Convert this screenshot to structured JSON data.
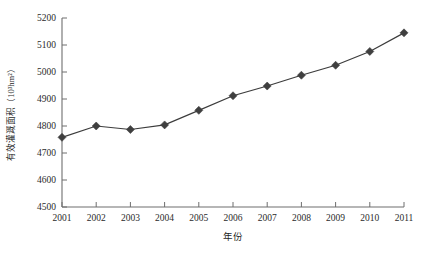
{
  "chart_data": {
    "type": "line",
    "title": "",
    "xlabel": "年份",
    "ylabel": "有效灌溉面积（10³hm²）",
    "categories": [
      "2001",
      "2002",
      "2003",
      "2004",
      "2005",
      "2006",
      "2007",
      "2008",
      "2009",
      "2010",
      "2011"
    ],
    "x": [
      2001,
      2002,
      2003,
      2004,
      2005,
      2006,
      2007,
      2008,
      2009,
      2010,
      2011
    ],
    "values": [
      4758,
      4800,
      4787,
      4804,
      4858,
      4912,
      4948,
      4988,
      5025,
      5076,
      5145
    ],
    "series": [
      {
        "name": "有效灌溉面积",
        "values": [
          4758,
          4800,
          4787,
          4804,
          4858,
          4912,
          4948,
          4988,
          5025,
          5076,
          5145
        ]
      }
    ],
    "ylim": [
      4500,
      5200
    ],
    "yticks": [
      4500,
      4600,
      4700,
      4800,
      4900,
      5000,
      5100,
      5200
    ],
    "ytick_labels": [
      "4500",
      "4600",
      "4700",
      "4800",
      "4900",
      "5000",
      "5100",
      "5200"
    ],
    "xlim": [
      2001,
      2011
    ],
    "xticks": [
      2001,
      2002,
      2003,
      2004,
      2005,
      2006,
      2007,
      2008,
      2009,
      2010,
      2011
    ],
    "grid": false,
    "legend": false,
    "legend_position": "none",
    "marker": "diamond",
    "marker_color": "#3f3f3f",
    "line_color": "#3c3c3c",
    "axis_color": "#6e6e6e",
    "background_color": "#ffffff"
  },
  "layout": {
    "plot_left": 62,
    "plot_right": 404,
    "plot_top": 18,
    "plot_bottom": 207
  }
}
